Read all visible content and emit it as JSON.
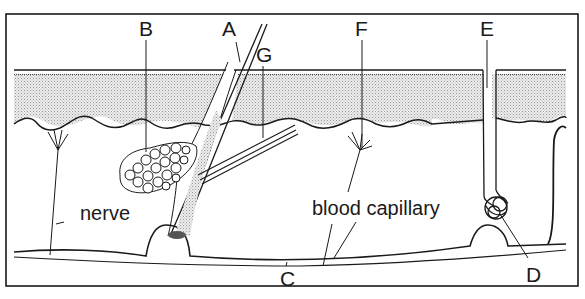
{
  "diagram": {
    "colors": {
      "ink": "#1a1a1a",
      "stipple": "#d4d4d4",
      "background": "#ffffff"
    },
    "labels": {
      "A": "A",
      "B": "B",
      "C": "C",
      "D": "D",
      "E": "E",
      "F": "F",
      "G": "G",
      "nerve": "nerve",
      "blood_capillary": "blood capillary"
    },
    "parts": [
      {
        "id": "A",
        "depicts": "hair"
      },
      {
        "id": "B",
        "depicts": "sebaceous gland"
      },
      {
        "id": "C",
        "depicts": "fat layer boundary"
      },
      {
        "id": "D",
        "depicts": "sweat gland coil"
      },
      {
        "id": "E",
        "depicts": "sweat pore / duct"
      },
      {
        "id": "F",
        "depicts": "nerve ending"
      },
      {
        "id": "G",
        "depicts": "erector muscle"
      }
    ]
  }
}
